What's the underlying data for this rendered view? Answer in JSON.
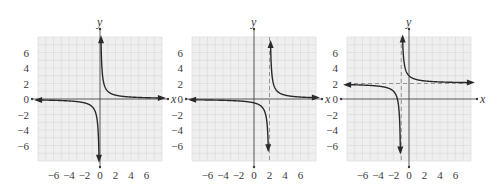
{
  "chart_data": [
    {
      "type": "line",
      "title": "",
      "function": "y = 1/x",
      "xlabel": "x",
      "ylabel": "y",
      "xlim": [
        -8,
        8
      ],
      "ylim": [
        -8,
        8
      ],
      "grid": true,
      "x_ticks": [
        -6,
        -4,
        -2,
        0,
        2,
        4,
        6
      ],
      "x_tick_labels": [
        "−6",
        "−4",
        "−2",
        "0",
        "2",
        "4",
        "6"
      ],
      "y_ticks": [
        6,
        4,
        2,
        0,
        -2,
        -4,
        -6
      ],
      "y_tick_labels": [
        "6",
        "4",
        "2",
        "0",
        "−2",
        "−4",
        "−6"
      ],
      "vertical_asymptote": null,
      "horizontal_asymptote": null,
      "dashed_asymptotes": false,
      "params": {
        "h": 0,
        "k": 0
      },
      "series": [
        {
          "name": "left branch",
          "x": [
            -8,
            -6,
            -4,
            -2,
            -1,
            -0.5,
            -0.125
          ],
          "y": [
            -0.125,
            -0.167,
            -0.25,
            -0.5,
            -1,
            -2,
            -8
          ]
        },
        {
          "name": "right branch",
          "x": [
            0.125,
            0.5,
            1,
            2,
            4,
            6,
            8
          ],
          "y": [
            8,
            2,
            1,
            0.5,
            0.25,
            0.167,
            0.125
          ]
        }
      ]
    },
    {
      "type": "line",
      "title": "",
      "function": "y = 1/(x − 2)",
      "xlabel": "x",
      "ylabel": "y",
      "xlim": [
        -8,
        8
      ],
      "ylim": [
        -8,
        8
      ],
      "grid": true,
      "x_ticks": [
        -6,
        -4,
        -2,
        0,
        2,
        4,
        6
      ],
      "x_tick_labels": [
        "−6",
        "−4",
        "−2",
        "0",
        "2",
        "4",
        "6"
      ],
      "y_ticks": [
        6,
        4,
        2,
        0,
        -2,
        -4,
        -6
      ],
      "y_tick_labels": [
        "6",
        "4",
        "2",
        "0",
        "−2",
        "−4",
        "−6"
      ],
      "vertical_asymptote": 2,
      "horizontal_asymptote": null,
      "dashed_asymptotes": true,
      "params": {
        "h": 2,
        "k": 0
      },
      "series": [
        {
          "name": "left branch",
          "x": [
            -8,
            -4,
            0,
            1,
            1.5,
            1.875
          ],
          "y": [
            -0.1,
            -0.167,
            -0.5,
            -1,
            -2,
            -8
          ]
        },
        {
          "name": "right branch",
          "x": [
            2.125,
            2.5,
            3,
            4,
            6,
            8
          ],
          "y": [
            8,
            2,
            1,
            0.5,
            0.25,
            0.167
          ]
        }
      ]
    },
    {
      "type": "line",
      "title": "",
      "function": "y = 1/(x + 1) + 2",
      "xlabel": "x",
      "ylabel": "y",
      "xlim": [
        -8,
        8
      ],
      "ylim": [
        -8,
        8
      ],
      "grid": true,
      "x_ticks": [
        -6,
        -4,
        -2,
        0,
        2,
        4,
        6
      ],
      "x_tick_labels": [
        "−6",
        "−4",
        "−2",
        "0",
        "2",
        "4",
        "6"
      ],
      "y_ticks": [
        6,
        4,
        2,
        0,
        -2,
        -4,
        -6
      ],
      "y_tick_labels": [
        "6",
        "4",
        "2",
        "0",
        "−2",
        "−4",
        "−6"
      ],
      "vertical_asymptote": -1,
      "horizontal_asymptote": 2,
      "dashed_asymptotes": true,
      "params": {
        "h": -1,
        "k": 2
      },
      "series": [
        {
          "name": "left branch",
          "x": [
            -8,
            -5,
            -3,
            -2,
            -1.5,
            -1.1
          ],
          "y": [
            1.857,
            1.75,
            1.5,
            1,
            0,
            -8
          ]
        },
        {
          "name": "right branch",
          "x": [
            -0.833,
            -0.5,
            0,
            1,
            3,
            8
          ],
          "y": [
            8,
            4,
            3,
            2.5,
            2.25,
            2.111
          ]
        }
      ]
    }
  ],
  "colors": {
    "curve": "#2a2a2a",
    "axis": "#3a3a3a",
    "grid_bg": "#efefef",
    "grid_line": "#d6d6d6",
    "dashed": "#8a8a8a"
  }
}
